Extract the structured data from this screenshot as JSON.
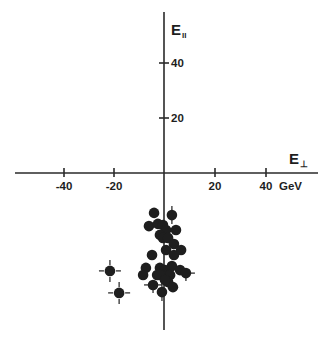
{
  "chart_data": {
    "type": "scatter",
    "title": "",
    "xlabel": "E⊥",
    "ylabel": "E∥",
    "x_unit": "GeV",
    "xlim": [
      -58,
      60
    ],
    "ylim": [
      -57,
      58
    ],
    "grid": false,
    "legend": null,
    "axes_style": "cross through origin",
    "x_ticks": [
      -40,
      -20,
      20,
      40
    ],
    "x_tick_labels": [
      "-40",
      "-20",
      "20",
      "40 GeV"
    ],
    "y_ticks": [
      20,
      40
    ],
    "y_tick_labels": [
      "20",
      "40"
    ],
    "series": [
      {
        "name": "events",
        "marker": "filled circle",
        "points": [
          {
            "x": -3.9,
            "y": -14.5
          },
          {
            "x": 3.1,
            "y": -15.3,
            "error_bar": "vertical"
          },
          {
            "x": -5.9,
            "y": -19.3
          },
          {
            "x": -2.4,
            "y": -18.5
          },
          {
            "x": -0.4,
            "y": -18.9
          },
          {
            "x": 0.8,
            "y": -20.7
          },
          {
            "x": -1.6,
            "y": -22.5
          },
          {
            "x": -0.4,
            "y": -23.6
          },
          {
            "x": 1.6,
            "y": -23.6
          },
          {
            "x": 4.7,
            "y": -20.7
          },
          {
            "x": 3.9,
            "y": -25.8
          },
          {
            "x": 0.8,
            "y": -28.0
          },
          {
            "x": 3.9,
            "y": -29.8
          },
          {
            "x": -4.7,
            "y": -29.8
          },
          {
            "x": 6.7,
            "y": -28.0
          },
          {
            "x": -7.1,
            "y": -34.5
          },
          {
            "x": -8.2,
            "y": -37.1
          },
          {
            "x": -1.6,
            "y": -34.5
          },
          {
            "x": 0.4,
            "y": -35.3
          },
          {
            "x": 3.1,
            "y": -33.8
          },
          {
            "x": 6.3,
            "y": -35.3
          },
          {
            "x": -2.7,
            "y": -37.1
          },
          {
            "x": -0.4,
            "y": -37.1
          },
          {
            "x": 2.4,
            "y": -37.1
          },
          {
            "x": 8.6,
            "y": -36.4,
            "error_bar": "both"
          },
          {
            "x": 1.6,
            "y": -39.6
          },
          {
            "x": 3.5,
            "y": -41.5
          },
          {
            "x": -4.3,
            "y": -40.7,
            "error_bar": "both"
          },
          {
            "x": -0.8,
            "y": -43.3,
            "error_bar": "vertical"
          },
          {
            "x": -1.6,
            "y": -37.1
          },
          {
            "x": 0.4,
            "y": -38.9
          },
          {
            "x": -21.2,
            "y": -35.6,
            "error_bar": "cross"
          },
          {
            "x": -17.6,
            "y": -43.6,
            "error_bar": "cross"
          }
        ]
      }
    ]
  },
  "labels": {
    "y_axis_main": "E",
    "y_axis_sub": "II",
    "x_axis_main": "E",
    "x_axis_sub": "⊥",
    "x_unit": "GeV",
    "tick_neg40": "-40",
    "tick_neg20": "-20",
    "tick_20": "20",
    "tick_40": "40",
    "ytick_20": "20",
    "ytick_40": "40"
  },
  "colors": {
    "ink": "#1e1e1e",
    "background": "#ffffff"
  }
}
